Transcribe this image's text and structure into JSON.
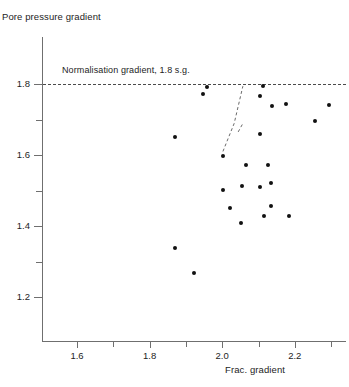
{
  "chart_data": {
    "type": "scatter",
    "title": "",
    "xlabel": "Frac. gradient",
    "ylabel": "Pore pressure gradient",
    "xlim": [
      1.5,
      2.34
    ],
    "ylim": [
      1.1,
      1.86
    ],
    "xticks": [
      1.6,
      1.8,
      2.0,
      2.2
    ],
    "xticklabels": [
      "1.6",
      "1.8",
      "2.0",
      "2.2"
    ],
    "xminorticks": [
      1.7,
      1.9,
      2.1,
      2.3
    ],
    "yticks": [
      1.2,
      1.4,
      1.6,
      1.8
    ],
    "yticklabels": [
      "1.2",
      "1.4",
      "1.6",
      "1.8"
    ],
    "yminorticks": [
      1.3,
      1.5,
      1.7
    ],
    "grid": false,
    "legend": false,
    "annotations": [
      {
        "name": "normalisation-gradient-label",
        "text": "Normalisation gradient, 1.8 s.g.",
        "x": 1.6,
        "y": 1.825
      }
    ],
    "reference_lines": [
      {
        "name": "normalisation-gradient-line",
        "orientation": "horizontal",
        "y": 1.8,
        "style": "dashed",
        "color": "#4a4a4a"
      }
    ],
    "trend_curve": {
      "name": "normalisation-trend-curve",
      "style": "dashed",
      "color": "#6a6a6a",
      "points": [
        [
          2.002,
          1.61
        ],
        [
          2.033,
          1.689
        ],
        [
          2.057,
          1.794
        ]
      ],
      "spur_points": [
        [
          2.044,
          1.665
        ],
        [
          2.057,
          1.689
        ]
      ]
    },
    "points": [
      {
        "x": 1.958,
        "y": 1.791
      },
      {
        "x": 1.947,
        "y": 1.772
      },
      {
        "x": 2.113,
        "y": 1.794
      },
      {
        "x": 2.104,
        "y": 1.766
      },
      {
        "x": 2.137,
        "y": 1.738
      },
      {
        "x": 2.176,
        "y": 1.744
      },
      {
        "x": 2.294,
        "y": 1.741
      },
      {
        "x": 2.256,
        "y": 1.696
      },
      {
        "x": 1.87,
        "y": 1.651
      },
      {
        "x": 2.104,
        "y": 1.659
      },
      {
        "x": 2.002,
        "y": 1.597
      },
      {
        "x": 2.065,
        "y": 1.572
      },
      {
        "x": 2.126,
        "y": 1.572
      },
      {
        "x": 2.002,
        "y": 1.501
      },
      {
        "x": 2.055,
        "y": 1.513
      },
      {
        "x": 2.104,
        "y": 1.51
      },
      {
        "x": 2.134,
        "y": 1.521
      },
      {
        "x": 2.022,
        "y": 1.452
      },
      {
        "x": 2.134,
        "y": 1.455
      },
      {
        "x": 2.115,
        "y": 1.428
      },
      {
        "x": 2.184,
        "y": 1.428
      },
      {
        "x": 2.052,
        "y": 1.408
      },
      {
        "x": 1.87,
        "y": 1.338
      },
      {
        "x": 1.922,
        "y": 1.268
      }
    ],
    "colors": {
      "marker": "#111111",
      "axis": "#6f6f6f",
      "dashed": "#4a4a4a"
    }
  },
  "axes": {
    "y_title": "Pore pressure gradient",
    "x_title": "Frac. gradient"
  }
}
